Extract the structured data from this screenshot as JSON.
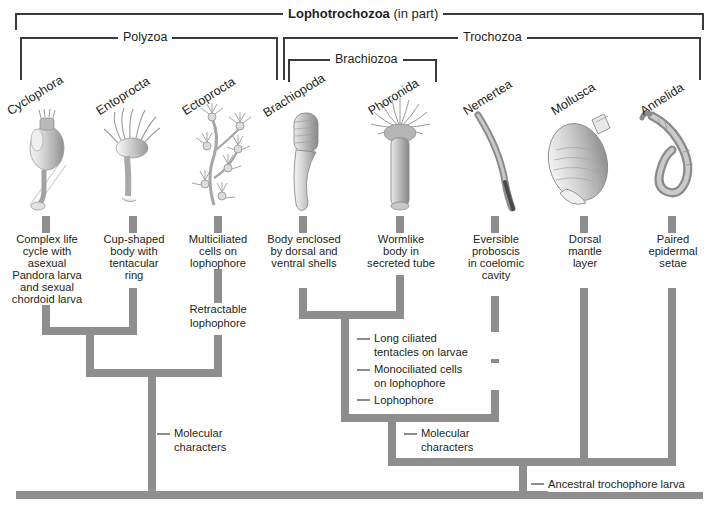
{
  "figure": {
    "title_bracket": {
      "bold": "Lophotrochozoa",
      "rest": " (in part)"
    },
    "clades": [
      {
        "id": "lophotrochozoa",
        "label": "Lophotrochozoa (in part)"
      },
      {
        "id": "polyzoa",
        "label": "Polyzoa"
      },
      {
        "id": "trochozoa",
        "label": "Trochozoa"
      },
      {
        "id": "brachiozoa",
        "label": "Brachiozoa"
      }
    ],
    "taxa": [
      {
        "name": "Cyclophora",
        "character": "Complex life\ncycle with\nasexual\nPandora larva\nand sexual\nchordoid larva"
      },
      {
        "name": "Entoprocta",
        "character": "Cup-shaped\nbody with\ntentacular\nring"
      },
      {
        "name": "Ectoprocta",
        "character": "Multiciliated\ncells on\nlophophore"
      },
      {
        "name": "Brachiopoda",
        "character": "Body enclosed\nby dorsal and\nventral shells"
      },
      {
        "name": "Phoronida",
        "character": "Wormlike\nbody in\nsecreted tube"
      },
      {
        "name": "Nemertea",
        "character": "Eversible\nproboscis\nin coelomic\ncavity"
      },
      {
        "name": "Mollusca",
        "character": "Dorsal\nmantle\nlayer"
      },
      {
        "name": "Annelida",
        "character": "Paired\nepidermal\nsetae"
      }
    ],
    "branch_labels": [
      {
        "id": "retractable-lophophore",
        "text": "Retractable\nlophophore"
      },
      {
        "id": "long-ciliated-tentacles",
        "text": "Long ciliated\ntentacles on larvae"
      },
      {
        "id": "monociliated-cells",
        "text": "Monociliated  cells\non lophophore"
      },
      {
        "id": "lophophore",
        "text": "Lophophore"
      },
      {
        "id": "molecular-characters-polyzoa",
        "text": "Molecular\ncharacters"
      },
      {
        "id": "molecular-characters-trochozoa",
        "text": "Molecular\ncharacters"
      },
      {
        "id": "ancestral-trochophore-larva",
        "text": "Ancestral trochophore larva"
      }
    ],
    "colors": {
      "branch": "#8e8e8e",
      "bracket": "#3b3b3b",
      "text": "#231f20",
      "background": "#ffffff"
    }
  }
}
